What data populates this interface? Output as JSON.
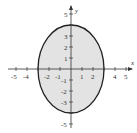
{
  "diagram": {
    "type": "ellipse-graph",
    "equation_semimajor_y": 4,
    "equation_semiminor_x": 3,
    "center": [
      0,
      0
    ],
    "fill_color": "#e3e3e3",
    "stroke_color": "#222222",
    "axes": {
      "x_label": "x",
      "y_label": "y",
      "x_ticks": [
        "-5",
        "-4",
        "-2",
        "-1",
        "1",
        "2",
        "4",
        "5"
      ],
      "y_ticks": [
        "5",
        "3",
        "2",
        "1",
        "-1",
        "-2",
        "-3",
        "-5"
      ]
    }
  }
}
